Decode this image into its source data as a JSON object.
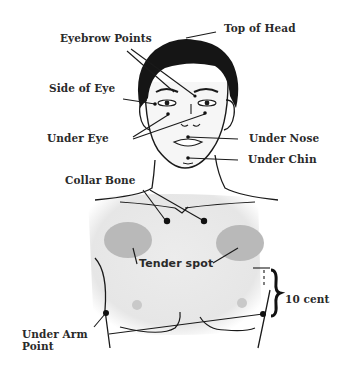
{
  "diagram": {
    "labels": {
      "top_of_head": "Top of Head",
      "eyebrow_points": "Eyebrow Points",
      "side_of_eye": "Side of Eye",
      "under_eye": "Under Eye",
      "under_nose": "Under Nose",
      "under_chin": "Under Chin",
      "collar_bone": "Collar Bone",
      "tender_spot": "Tender spot",
      "ten_cent": "10 cent",
      "under_arm_line1": "Under Arm",
      "under_arm_line2": "Point"
    },
    "colors": {
      "line": "#1a1a1a",
      "hair": "#151515",
      "skin_torso": "#e9e9e9",
      "tender_spot_fill": "#b9b9b9",
      "nipple_fill": "#c9c9c9",
      "background": "#ffffff"
    }
  }
}
